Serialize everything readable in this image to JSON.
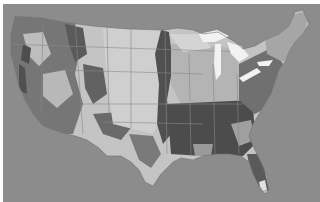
{
  "map": {
    "type": "choropleth-grayscale",
    "subject": "Contiguous United States land cover",
    "colors": {
      "background": "#8c8c8c",
      "land_light": "#c9c9c9",
      "land_mid": "#a8a8a8",
      "land_dark": "#5e5e5e",
      "forest_dense": "#4a4a4a",
      "water": "#f2f2f2",
      "boundary": "#7a7a7a"
    }
  }
}
